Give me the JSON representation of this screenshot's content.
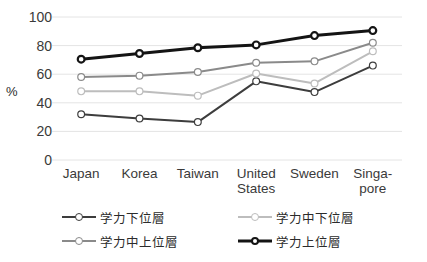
{
  "chart_data": {
    "type": "line",
    "title": "",
    "subtitle": "",
    "xlabel": "",
    "ylabel": "%",
    "ylim": [
      0,
      100
    ],
    "yticks": [
      0,
      20,
      40,
      60,
      80,
      100
    ],
    "grid": "horizontal",
    "legend_position": "bottom",
    "categories": [
      "Japan",
      "Korea",
      "Taiwan",
      "United\nStates",
      "Sweden",
      "Singa-\npore"
    ],
    "category_labels_flat": [
      "Japan",
      "Korea",
      "Taiwan",
      "United States",
      "Sweden",
      "Singapore"
    ],
    "series": [
      {
        "name": "学力下位層",
        "color": "#3d3d3d",
        "width": 2.0,
        "values": [
          32,
          29,
          26.5,
          55,
          47.5,
          66
        ]
      },
      {
        "name": "学力中下位層",
        "color": "#bdbdbd",
        "width": 2.0,
        "values": [
          48,
          48,
          45,
          60.5,
          53.5,
          76
        ]
      },
      {
        "name": "学力中上位層",
        "color": "#8a8a8a",
        "width": 2.0,
        "values": [
          58,
          59,
          61.5,
          68,
          69,
          82
        ]
      },
      {
        "name": "学力上位層",
        "color": "#141414",
        "width": 3.0,
        "values": [
          70.5,
          74.5,
          78.5,
          80.5,
          87,
          90.5
        ]
      }
    ]
  },
  "legend": {
    "items": [
      {
        "label": "学力下位層",
        "color": "#3d3d3d",
        "width": 2.0
      },
      {
        "label": "学力中下位層",
        "color": "#bdbdbd",
        "width": 2.0
      },
      {
        "label": "学力中上位層",
        "color": "#8a8a8a",
        "width": 2.0
      },
      {
        "label": "学力上位層",
        "color": "#141414",
        "width": 3.0
      }
    ],
    "order": [
      0,
      1,
      2,
      3
    ]
  },
  "style": {
    "gridline_color": "#e4e4e4",
    "marker_fill": "#ffffff",
    "background": "#ffffff",
    "text_color": "#3a3a3a"
  }
}
